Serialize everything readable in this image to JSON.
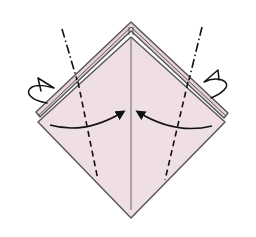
{
  "diagram": {
    "type": "origami-step",
    "colors": {
      "background": "#ffffff",
      "paper": "#efdfe2",
      "paper_back": "#e8d6da",
      "outline": "#555555",
      "line": "#111111"
    },
    "elements": {
      "paper_front": "front-diamond",
      "paper_back_layers": "back-layer-edges",
      "center_crease": "vertical-center-crease",
      "fold_lines": [
        {
          "side": "left",
          "type": "valley-fold-dashed"
        },
        {
          "side": "right",
          "type": "valley-fold-dashed"
        }
      ],
      "mountain_lines": [
        {
          "side": "left",
          "type": "mountain-fold-dash-dot"
        },
        {
          "side": "right",
          "type": "mountain-fold-dash-dot"
        }
      ],
      "arrows": [
        {
          "side": "left",
          "type": "fold-in-arrow",
          "direction": "toward-center"
        },
        {
          "side": "right",
          "type": "fold-in-arrow",
          "direction": "toward-center"
        },
        {
          "side": "left",
          "type": "fold-behind-arrow",
          "direction": "behind"
        },
        {
          "side": "right",
          "type": "fold-behind-arrow",
          "direction": "behind"
        }
      ]
    }
  }
}
